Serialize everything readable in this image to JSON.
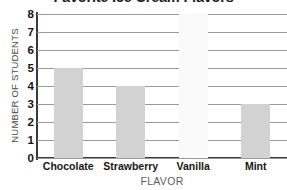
{
  "chart_data": {
    "type": "bar",
    "title": "Favorite Ice Cream Flavors",
    "xlabel": "FLAVOR",
    "ylabel": "NUMBER OF STUDENTS",
    "categories": [
      "Chocolate",
      "Strawberry",
      "Vanilla",
      "Mint"
    ],
    "values": [
      5,
      4,
      8,
      3
    ],
    "ylim": [
      0,
      8
    ],
    "yticks": [
      0,
      1,
      2,
      3,
      4,
      5,
      6,
      7,
      8
    ],
    "grid": true,
    "legend": false,
    "bar_color": "#d2d2d2",
    "bar_colors": [
      "#d2d2d2",
      "#d2d2d2",
      "#fafafa",
      "#d2d2d2"
    ],
    "gridline_color": "#9a9a9a",
    "axis_color": "#3a3a3a",
    "title_color": "#1d1d1d"
  }
}
